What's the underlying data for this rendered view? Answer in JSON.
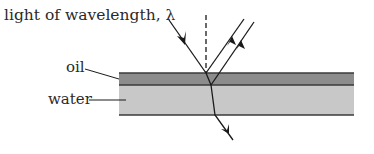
{
  "diagram": {
    "title_text": "light of wavelength, λ",
    "labels": {
      "oil": "oil",
      "water": "water"
    },
    "colors": {
      "oil_layer": "#8c8c8c",
      "water_layer": "#c8c8c8",
      "lines": "#1a1a1a"
    },
    "elements": [
      "incident ray",
      "normal (dashed)",
      "reflected ray from top surface of oil",
      "reflected ray from oil-water interface",
      "refracted ray through water"
    ]
  }
}
